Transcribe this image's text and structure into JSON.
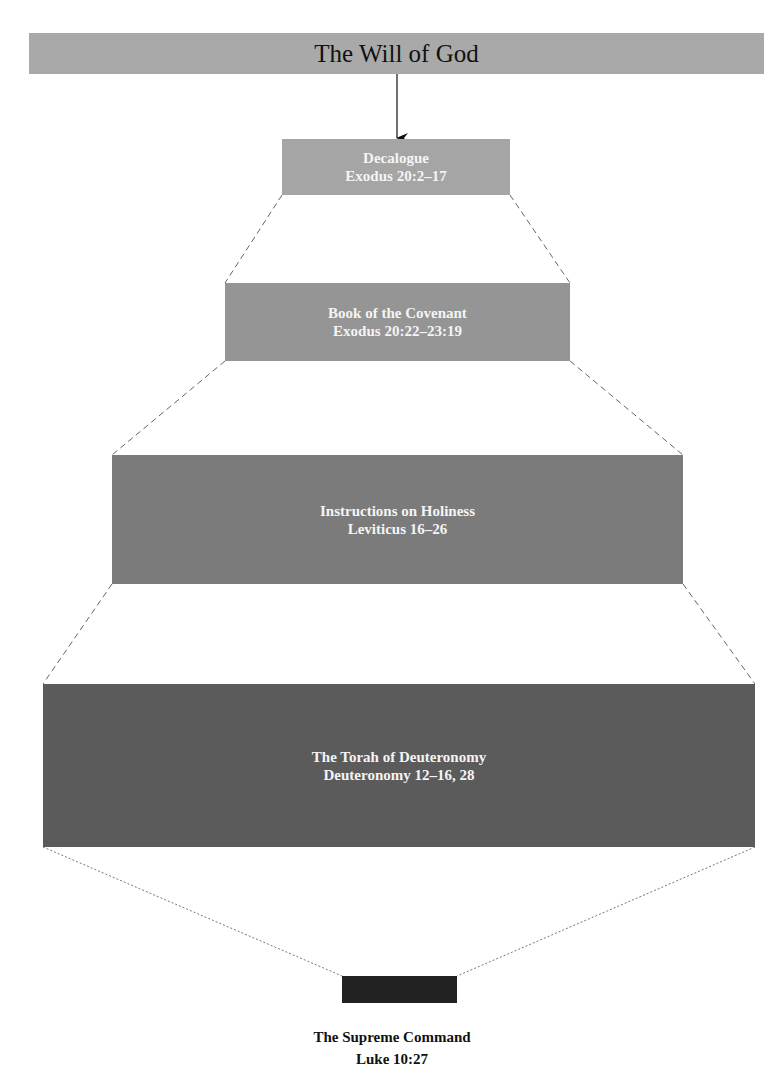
{
  "diagram": {
    "title": "The Will of God",
    "levels": [
      {
        "name": "Decalogue",
        "reference": "Exodus 20:2–17"
      },
      {
        "name": "Book of the Covenant",
        "reference": "Exodus 20:22–23:19"
      },
      {
        "name": "Instructions on Holiness",
        "reference": "Leviticus 16–26"
      },
      {
        "name": "The Torah of Deuteronomy",
        "reference": "Deuteronomy 12–16, 28"
      }
    ],
    "summary": {
      "name": "The Supreme Command",
      "reference": "Luke 10:27"
    }
  },
  "colors": {
    "title_bar": "#a9a9a9",
    "level_1": "#a5a5a5",
    "level_2": "#959595",
    "level_3": "#7b7b7b",
    "level_4": "#5b5b5b",
    "summary_box": "#222222"
  }
}
